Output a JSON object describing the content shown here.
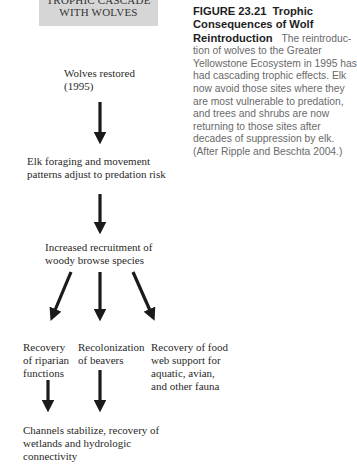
{
  "title_box": {
    "line1": "TROPHIC CASCADE",
    "line2": "WITH WOLVES",
    "background": "#d6d6d6"
  },
  "nodes": {
    "wolves": {
      "line1": "Wolves restored",
      "line2": "(1995)"
    },
    "elk": {
      "line1": "Elk foraging and movement",
      "line2": "patterns adjust to predation risk"
    },
    "woody": {
      "line1": "Increased recruitment of",
      "line2": "woody browse species"
    },
    "riparian": {
      "line1": "Recovery",
      "line2": "of riparian",
      "line3": "functions"
    },
    "beavers": {
      "line1": "Recolonization",
      "line2": "of beavers"
    },
    "foodweb": {
      "line1": "Recovery of food",
      "line2": "web support for",
      "line3": "aquatic, avian,",
      "line4": "and other fauna"
    },
    "channels": {
      "line1": "Channels stabilize, recovery of",
      "line2": "wetlands and hydrologic",
      "line3": "connectivity"
    }
  },
  "caption": {
    "figure_label": "FIGURE 23.21",
    "figure_title_1": "Trophic",
    "figure_title_2": "Consequences of Wolf",
    "figure_title_3": "Reintroduction",
    "body_1": "The reintroduc-",
    "body_2": "tion of wolves to the Greater",
    "body_3": "Yellowstone Ecosystem in 1995 has",
    "body_4": "had cascading trophic effects. Elk",
    "body_5": "now avoid those sites where they",
    "body_6": "are most vulnerable to predation,",
    "body_7": "and trees and shrubs are now",
    "body_8": "returning to those sites after",
    "body_9": "decades of suppression by elk.",
    "body_10": "(After Ripple and Beschta 2004.)"
  },
  "arrows": [
    {
      "from": "wolves",
      "to": "elk",
      "direction": "down"
    },
    {
      "from": "elk",
      "to": "woody",
      "direction": "down"
    },
    {
      "from": "woody",
      "to": "riparian",
      "direction": "down-left"
    },
    {
      "from": "woody",
      "to": "beavers",
      "direction": "down"
    },
    {
      "from": "woody",
      "to": "foodweb",
      "direction": "down-right"
    },
    {
      "from": "riparian",
      "to": "channels",
      "direction": "down"
    },
    {
      "from": "beavers",
      "to": "channels",
      "direction": "down"
    }
  ]
}
